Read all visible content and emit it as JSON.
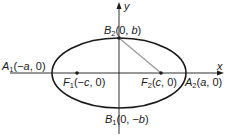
{
  "diagram": {
    "axes": {
      "x_label": "x",
      "y_label": "y"
    },
    "points": {
      "A1": {
        "name": "A",
        "sub": "1",
        "coords_pre": "(−",
        "var": "a",
        "coords_post": ", 0)"
      },
      "A2": {
        "name": "A",
        "sub": "2",
        "coords_pre": "(",
        "var": "a",
        "coords_post": ", 0)"
      },
      "B1": {
        "name": "B",
        "sub": "1",
        "coords_pre": "(0, −",
        "var": "b",
        "coords_post": ")"
      },
      "B2": {
        "name": "B",
        "sub": "2",
        "coords_pre": "(0, ",
        "var": "b",
        "coords_post": ")"
      },
      "F1": {
        "name": "F",
        "sub": "1",
        "coords_pre": "(−",
        "var": "c",
        "coords_post": ", 0)"
      },
      "F2": {
        "name": "F",
        "sub": "2",
        "coords_pre": "(",
        "var": "c",
        "coords_post": ", 0)"
      }
    },
    "colors": {
      "curve": "#1a1a1a",
      "segment": "#999999",
      "axes": "#1a1a1a"
    }
  }
}
